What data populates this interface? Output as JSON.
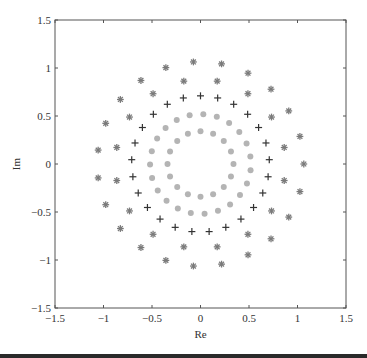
{
  "chart_data": {
    "type": "scatter",
    "title": "",
    "xlabel": "Re",
    "ylabel": "Im",
    "xlim": [
      -1.5,
      1.5
    ],
    "ylim": [
      -1.5,
      1.5
    ],
    "grid": false,
    "legend": null,
    "xticks": [
      -1.5,
      -1,
      -0.5,
      0,
      0.5,
      1,
      1.5
    ],
    "xtick_labels": [
      "−1.5",
      "−1",
      "−0.5",
      "0",
      "0.5",
      "1",
      "1.5"
    ],
    "yticks": [
      -1.5,
      -1,
      -0.5,
      0,
      0.5,
      1,
      1.5
    ],
    "ytick_labels": [
      "−1.5",
      "−1",
      "−0.5",
      "0",
      "0.5",
      "1",
      "1.5"
    ],
    "series": [
      {
        "name": "outer-asterisk-ring",
        "marker": "asterisk",
        "color": "#7a7a7a",
        "points": [
          [
            1.065,
            0
          ],
          [
            1.025,
            0.287
          ],
          [
            0.91,
            0.553
          ],
          [
            0.727,
            0.779
          ],
          [
            0.49,
            0.946
          ],
          [
            0.217,
            1.043
          ],
          [
            -0.073,
            1.063
          ],
          [
            -0.357,
            1.004
          ],
          [
            -0.614,
            0.87
          ],
          [
            -0.826,
            0.672
          ],
          [
            -0.977,
            0.424
          ],
          [
            -1.055,
            0.145
          ],
          [
            -1.055,
            -0.145
          ],
          [
            -0.977,
            -0.424
          ],
          [
            -0.826,
            -0.672
          ],
          [
            -0.614,
            -0.87
          ],
          [
            -0.357,
            -1.004
          ],
          [
            -0.073,
            -1.063
          ],
          [
            0.217,
            -1.043
          ],
          [
            0.49,
            -0.946
          ],
          [
            0.727,
            -0.779
          ],
          [
            0.91,
            -0.553
          ],
          [
            1.025,
            -0.287
          ]
        ]
      },
      {
        "name": "inner-asterisk-ring",
        "marker": "asterisk",
        "color": "#7a7a7a",
        "points": [
          [
            0.863,
            0.172
          ],
          [
            0.732,
            0.489
          ],
          [
            0.489,
            0.732
          ],
          [
            0.172,
            0.863
          ],
          [
            -0.172,
            0.863
          ],
          [
            -0.489,
            0.732
          ],
          [
            -0.732,
            0.489
          ],
          [
            -0.863,
            0.172
          ],
          [
            -0.863,
            -0.172
          ],
          [
            -0.732,
            -0.489
          ],
          [
            -0.489,
            -0.732
          ],
          [
            -0.172,
            -0.863
          ],
          [
            0.172,
            -0.863
          ],
          [
            0.489,
            -0.732
          ],
          [
            0.732,
            -0.489
          ],
          [
            0.863,
            -0.172
          ]
        ]
      },
      {
        "name": "plus-ring",
        "marker": "plus",
        "color": "#333333",
        "points": [
          [
            0,
            0.71
          ],
          [
            0.177,
            0.688
          ],
          [
            0.342,
            0.622
          ],
          [
            0.486,
            0.518
          ],
          [
            0.599,
            0.38
          ],
          [
            0.675,
            0.219
          ],
          [
            0.709,
            0.045
          ],
          [
            0.697,
            -0.133
          ],
          [
            0.642,
            -0.302
          ],
          [
            0.547,
            -0.453
          ],
          [
            0.417,
            -0.574
          ],
          [
            0.261,
            -0.66
          ],
          [
            0.089,
            -0.704
          ],
          [
            -0.089,
            -0.704
          ],
          [
            -0.261,
            -0.66
          ],
          [
            -0.417,
            -0.574
          ],
          [
            -0.547,
            -0.453
          ],
          [
            -0.642,
            -0.302
          ],
          [
            -0.697,
            -0.133
          ],
          [
            -0.709,
            0.045
          ],
          [
            -0.675,
            0.219
          ],
          [
            -0.599,
            0.38
          ],
          [
            -0.486,
            0.518
          ],
          [
            -0.342,
            0.622
          ],
          [
            -0.177,
            0.688
          ]
        ]
      },
      {
        "name": "outer-circle-ring",
        "marker": "circle",
        "color": "#b4b4b4",
        "points": [
          [
            0.514,
            0.077
          ],
          [
            0.475,
            0.213
          ],
          [
            0.4,
            0.333
          ],
          [
            0.295,
            0.428
          ],
          [
            0.168,
            0.492
          ],
          [
            0.029,
            0.519
          ],
          [
            -0.112,
            0.508
          ],
          [
            -0.245,
            0.459
          ],
          [
            -0.36,
            0.376
          ],
          [
            -0.447,
            0.265
          ],
          [
            -0.502,
            0.134
          ],
          [
            -0.52,
            -0.006
          ],
          [
            -0.499,
            -0.146
          ],
          [
            -0.441,
            -0.275
          ],
          [
            -0.35,
            -0.384
          ],
          [
            -0.234,
            -0.464
          ],
          [
            -0.1,
            -0.51
          ],
          [
            0.042,
            -0.518
          ],
          [
            0.18,
            -0.488
          ],
          [
            0.305,
            -0.421
          ],
          [
            0.407,
            -0.323
          ],
          [
            0.479,
            -0.202
          ],
          [
            0.516,
            -0.065
          ]
        ]
      },
      {
        "name": "inner-circle-ring",
        "marker": "circle",
        "color": "#b4b4b4",
        "points": [
          [
            0.34,
            0
          ],
          [
            0.314,
            0.13
          ],
          [
            0.24,
            0.24
          ],
          [
            0.13,
            0.314
          ],
          [
            0,
            0.34
          ],
          [
            -0.13,
            0.314
          ],
          [
            -0.24,
            0.24
          ],
          [
            -0.314,
            0.13
          ],
          [
            -0.34,
            0
          ],
          [
            -0.314,
            -0.13
          ],
          [
            -0.24,
            -0.24
          ],
          [
            -0.13,
            -0.314
          ],
          [
            0,
            -0.34
          ],
          [
            0.13,
            -0.314
          ],
          [
            0.24,
            -0.24
          ],
          [
            0.314,
            -0.13
          ]
        ]
      }
    ]
  },
  "layout": {
    "plot_left": 55,
    "plot_top": 20,
    "plot_right": 346,
    "plot_bottom": 308,
    "axis_color": "#555555"
  }
}
